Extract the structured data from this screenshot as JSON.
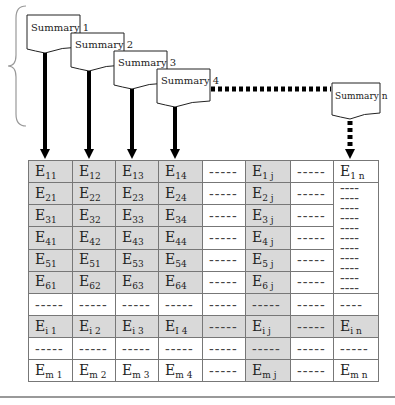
{
  "summaries": [
    {
      "label": "Summary 1"
    },
    {
      "label": "Summary 2"
    },
    {
      "label": "Summary 3"
    },
    {
      "label": "Summary 4"
    },
    {
      "label": "Summary n"
    }
  ],
  "table": {
    "dash": "-----",
    "short_dash": "----",
    "rows": [
      {
        "c1": "E",
        "s1": "11",
        "c2": "E",
        "s2": "12",
        "c3": "E",
        "s3": "13",
        "c4": "E",
        "s4": "14",
        "cj": "E",
        "sj": "1 j",
        "cn": "E",
        "sn": "1 n"
      },
      {
        "c1": "E",
        "s1": "21",
        "c2": "E",
        "s2": "22",
        "c3": "E",
        "s3": "23",
        "c4": "E",
        "s4": "24",
        "cj": "E",
        "sj": "2 j"
      },
      {
        "c1": "E",
        "s1": "31",
        "c2": "E",
        "s2": "32",
        "c3": "E",
        "s3": "33",
        "c4": "E",
        "s4": "34",
        "cj": "E",
        "sj": "3 j"
      },
      {
        "c1": "E",
        "s1": "41",
        "c2": "E",
        "s2": "42",
        "c3": "E",
        "s3": "43",
        "c4": "E",
        "s4": "44",
        "cj": "E",
        "sj": "4 j"
      },
      {
        "c1": "E",
        "s1": "51",
        "c2": "E",
        "s2": "51",
        "c3": "E",
        "s3": "53",
        "c4": "E",
        "s4": "54",
        "cj": "E",
        "sj": "5 j"
      },
      {
        "c1": "E",
        "s1": "61",
        "c2": "E",
        "s2": "62",
        "c3": "E",
        "s3": "63",
        "c4": "E",
        "s4": "64",
        "cj": "E",
        "sj": "6 j"
      },
      {},
      {
        "c1": "E",
        "s1": "i 1",
        "c2": "E",
        "s2": "i 2",
        "c3": "E",
        "s3": "i 3",
        "c4": "E",
        "s4": "I 4",
        "cj": "E",
        "sj": "i j",
        "cn": "E",
        "sn": "i n"
      },
      {},
      {
        "c1": "E",
        "s1": "m 1",
        "c2": "E",
        "s2": "m 2",
        "c3": "E",
        "s3": "m 3",
        "c4": "E",
        "s4": "m 4",
        "cj": "E",
        "sj": "m j",
        "cn": "E",
        "sn": "m n"
      }
    ]
  }
}
